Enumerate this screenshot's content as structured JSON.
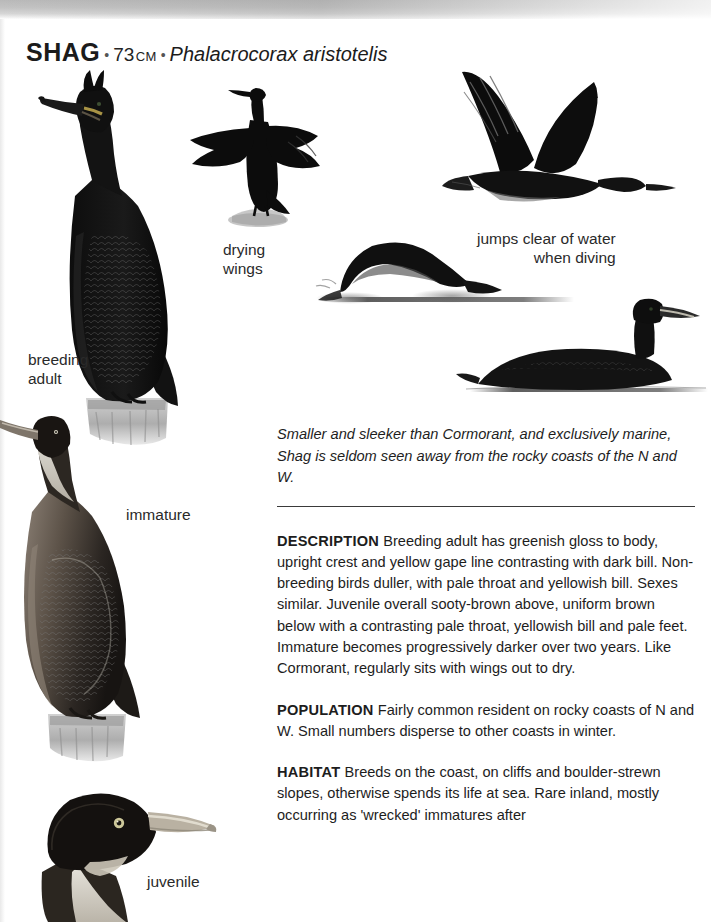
{
  "header": {
    "species_name": "SHAG",
    "separator": "•",
    "size_value": "73",
    "size_unit": "CM",
    "latin_name": "Phalacrocorax aristotelis"
  },
  "plate_labels": {
    "breeding_adult": "breeding\nadult",
    "drying_wings": "drying\nwings",
    "immature": "immature",
    "juvenile": "juvenile",
    "jumps_clear": "jumps clear of water\nwhen diving"
  },
  "text": {
    "intro": "Smaller and sleeker than Cormorant, and exclusively marine, Shag is seldom seen away from the rocky coasts of the N and W.",
    "sections": [
      {
        "heading": "DESCRIPTION",
        "body": "Breeding adult has greenish gloss to body, upright crest and yellow gape line contrasting with dark bill. Non-breeding birds duller, with pale throat and yellowish bill. Sexes similar. Juvenile overall sooty-brown above, uniform brown below with a contrasting pale throat, yellowish bill and pale feet. Immature becomes progressively darker over two years. Like Cormorant, regularly sits with wings out to dry."
      },
      {
        "heading": "POPULATION",
        "body": "Fairly common resident on rocky coasts of N and W. Small numbers disperse to other coasts in winter."
      },
      {
        "heading": "HABITAT",
        "body": "Breeds on the coast, on cliffs and boulder-strewn slopes, otherwise spends its life at sea. Rare inland, mostly occurring as 'wrecked' immatures after"
      }
    ]
  },
  "illustrations": [
    {
      "name": "breeding-adult-perched-shag",
      "caption": "breeding adult"
    },
    {
      "name": "shag-drying-wings-silhouette",
      "caption": "drying wings"
    },
    {
      "name": "shag-in-flight",
      "caption": ""
    },
    {
      "name": "shag-jumping-clear-of-water",
      "caption": "jumps clear of water when diving"
    },
    {
      "name": "shag-swimming",
      "caption": ""
    },
    {
      "name": "immature-shag-perched",
      "caption": "immature"
    },
    {
      "name": "juvenile-shag-head",
      "caption": "juvenile"
    }
  ],
  "colors": {
    "ink": "#1d1d1d",
    "plumage_dark": "#141414",
    "plumage_brown": "#4a4038",
    "pale_throat": "#d8d2c6",
    "gape_yellow": "#b9a24b",
    "perch_grey": "#b9b9b9"
  }
}
